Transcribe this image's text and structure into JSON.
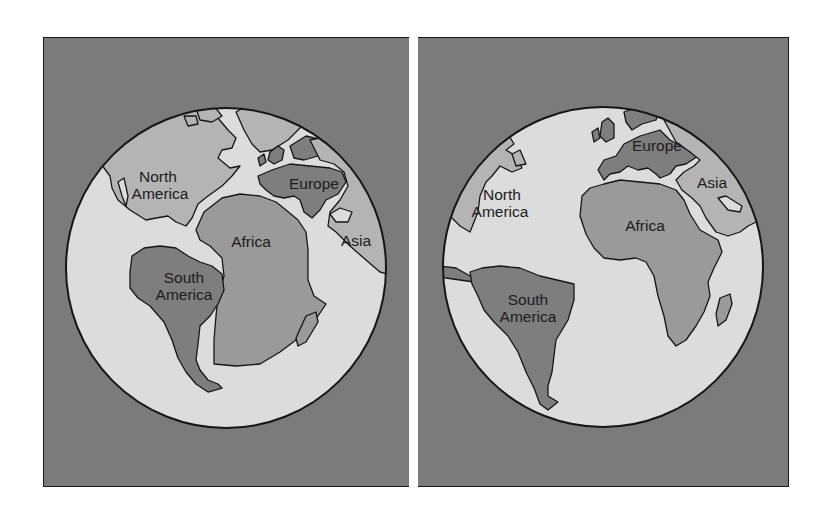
{
  "figure": {
    "colors": {
      "background": "#ffffff",
      "frame_fill": "#7b7b7b",
      "frame_border": "#1a1a1a",
      "ocean": "#dcdcdc",
      "land_light": "#b4b4b4",
      "land_mid": "#9a9a9a",
      "land_dark": "#7e7e7e",
      "outline": "#161616",
      "label": "#1c1c1c"
    },
    "panels": [
      {
        "id": "past",
        "labels": {
          "north_america_line1": "North",
          "north_america_line2": "America",
          "europe": "Europe",
          "africa": "Africa",
          "asia": "Asia",
          "south_america_line1": "South",
          "south_america_line2": "America"
        }
      },
      {
        "id": "present",
        "labels": {
          "north_america_line1": "North",
          "north_america_line2": "America",
          "europe": "Europe",
          "africa": "Africa",
          "asia": "Asia",
          "south_america_line1": "South",
          "south_america_line2": "America"
        }
      }
    ]
  }
}
